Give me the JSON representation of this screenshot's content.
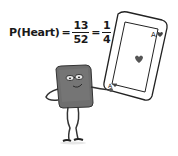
{
  "formula": {
    "lhs": "P(Heart)",
    "equals": "=",
    "fraction1": {
      "numerator": "13",
      "denominator": "52"
    },
    "fraction2": {
      "numerator": "1",
      "denominator": "4"
    }
  },
  "card": {
    "rank_top": "A",
    "rank_bottom": "A",
    "suit": "heart",
    "center_icon": "heart-icon"
  },
  "character": {
    "description": "gray card character with glasses holding a large ace of hearts card",
    "body_color": "#6e6e6e"
  }
}
